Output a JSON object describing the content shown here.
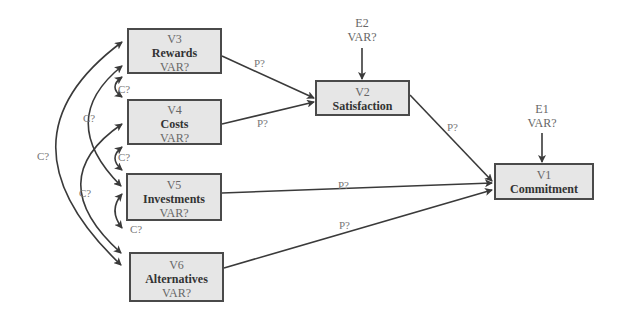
{
  "nodes": {
    "v3": {
      "id": "V3",
      "name": "Rewards",
      "var": "VAR?"
    },
    "v4": {
      "id": "V4",
      "name": "Costs",
      "var": "VAR?"
    },
    "v5": {
      "id": "V5",
      "name": "Investments",
      "var": "VAR?"
    },
    "v6": {
      "id": "V6",
      "name": "Alternatives",
      "var": "VAR?"
    },
    "v2": {
      "id": "V2",
      "name": "Satisfaction"
    },
    "v1": {
      "id": "V1",
      "name": "Commitment"
    }
  },
  "errors": {
    "e2": {
      "id": "E2",
      "var": "VAR?"
    },
    "e1": {
      "id": "E1",
      "var": "VAR?"
    }
  },
  "paths": {
    "v3_v2": "P?",
    "v4_v2": "P?",
    "v2_v1": "P?",
    "v5_v1": "P?",
    "v6_v1": "P?"
  },
  "covariances": {
    "v3_v4": "C?",
    "v4_v5": "C?",
    "v5_v6": "C?",
    "v3_v5": "C?",
    "v4_v6": "C?",
    "v3_v6": "C?"
  }
}
